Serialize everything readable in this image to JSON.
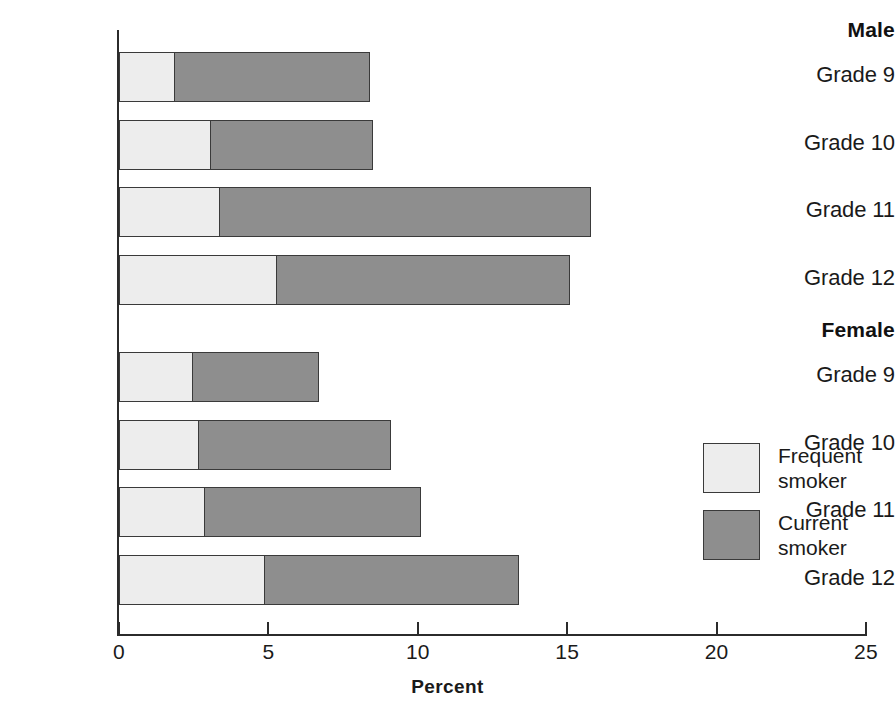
{
  "chart_data": {
    "type": "bar",
    "orientation": "horizontal",
    "stacked": true,
    "title": "",
    "xlabel": "Percent",
    "ylabel": "",
    "xlim": [
      0,
      25
    ],
    "xticks": [
      0,
      5,
      10,
      15,
      20,
      25
    ],
    "xtick_labels": [
      "0",
      "5",
      "10",
      "15",
      "20",
      "25"
    ],
    "grid": false,
    "legend_position": "right",
    "categories": [
      "Male Grade 9",
      "Male Grade 10",
      "Male Grade 11",
      "Male Grade 12",
      "Female Grade 9",
      "Female Grade 10",
      "Female Grade 11",
      "Female Grade 12"
    ],
    "series": [
      {
        "name": "Frequent smoker",
        "color": "#ededed",
        "values": [
          1.9,
          3.1,
          3.4,
          5.3,
          2.5,
          2.7,
          2.9,
          4.9
        ]
      },
      {
        "name": "Current smoker",
        "color": "#8e8e8e",
        "values": [
          6.5,
          5.4,
          12.4,
          9.8,
          4.2,
          6.4,
          7.2,
          8.5
        ]
      }
    ],
    "totals": [
      8.4,
      8.5,
      15.8,
      15.1,
      6.7,
      9.1,
      10.1,
      13.4
    ]
  },
  "groups": [
    {
      "label": "Male",
      "rows": [
        {
          "label": "Grade 9",
          "frequent": 1.9,
          "total": 8.4
        },
        {
          "label": "Grade 10",
          "frequent": 3.1,
          "total": 8.5
        },
        {
          "label": "Grade 11",
          "frequent": 3.4,
          "total": 15.8
        },
        {
          "label": "Grade 12",
          "frequent": 5.3,
          "total": 15.1
        }
      ]
    },
    {
      "label": "Female",
      "rows": [
        {
          "label": "Grade 9",
          "frequent": 2.5,
          "total": 6.7
        },
        {
          "label": "Grade 10",
          "frequent": 2.7,
          "total": 9.1
        },
        {
          "label": "Grade 11",
          "frequent": 2.9,
          "total": 10.1
        },
        {
          "label": "Grade 12",
          "frequent": 4.9,
          "total": 13.4
        }
      ]
    }
  ],
  "axis": {
    "title": "Percent",
    "ticks": [
      "0",
      "5",
      "10",
      "15",
      "20",
      "25"
    ],
    "min": 0,
    "max": 25
  },
  "legend": {
    "items": [
      {
        "line1": "Frequent",
        "line2": "smoker",
        "color": "#ededed"
      },
      {
        "line1": "Current",
        "line2": "smoker",
        "color": "#8e8e8e"
      }
    ]
  }
}
